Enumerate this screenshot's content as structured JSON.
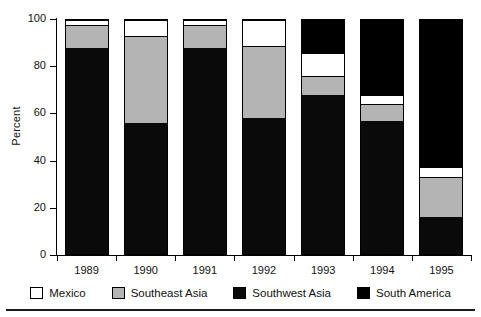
{
  "chart_data": {
    "type": "bar",
    "subtype": "stacked-bar-100-percent",
    "title": "",
    "xlabel": "",
    "ylabel": "Percent",
    "ylim": [
      0,
      100
    ],
    "yticks": [
      0,
      20,
      40,
      60,
      80,
      100
    ],
    "ytick_labels": [
      "0",
      "20",
      "40",
      "60",
      "80",
      "100"
    ],
    "grid": false,
    "legend_position": "bottom",
    "categories": [
      "1989",
      "1990",
      "1991",
      "1992",
      "1993",
      "1994",
      "1995"
    ],
    "series": [
      {
        "name": "Southwest Asia",
        "color": "#0a0a0a",
        "values": [
          88,
          56,
          88,
          58,
          68,
          57,
          16
        ]
      },
      {
        "name": "Southeast Asia",
        "color": "#b4b4b4",
        "values": [
          10,
          37,
          10,
          31,
          8,
          7,
          17
        ]
      },
      {
        "name": "Mexico",
        "color": "#ffffff",
        "values": [
          2,
          7,
          2,
          11,
          10,
          4,
          4
        ]
      },
      {
        "name": "South America",
        "color": "#000000",
        "values": [
          0,
          0,
          0,
          0,
          14,
          32,
          63
        ]
      }
    ],
    "legend_entries": [
      {
        "label": "Mexico",
        "swatch": "mx"
      },
      {
        "label": "Southeast Asia",
        "swatch": "se"
      },
      {
        "label": "Southwest Asia",
        "swatch": "sw"
      },
      {
        "label": "South America",
        "swatch": "sa"
      }
    ]
  }
}
